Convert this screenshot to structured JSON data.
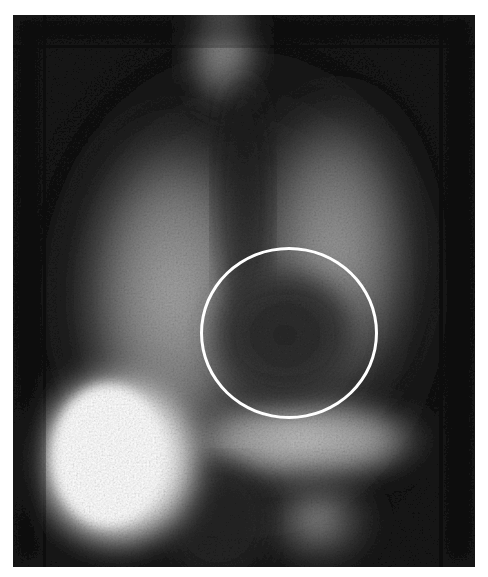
{
  "figure": {
    "type": "grayscale nuclear medicine scintigraphy (anterior chest view)",
    "description": "Perfusion/uptake scan showing bilateral lung fields, a bright hepatic region lower-left, thyroid/neck uptake at top center, and a circled photopenic region (cardiac area) center-right",
    "frame": {
      "x": 13,
      "y": 15,
      "width": 462,
      "height": 552
    },
    "background_color": "#ffffff",
    "scan_base_color": "#0c0c0c",
    "regions": [
      {
        "name": "neck-uptake",
        "cx": 210,
        "cy": 35,
        "rx": 45,
        "ry": 70,
        "intensity": 0.55
      },
      {
        "name": "right-lung-field",
        "cx": 150,
        "cy": 270,
        "rx": 110,
        "ry": 190,
        "intensity": 0.55
      },
      {
        "name": "left-lung-field",
        "cx": 320,
        "cy": 250,
        "rx": 95,
        "ry": 170,
        "intensity": 0.5
      },
      {
        "name": "liver-hot-spot",
        "cx": 110,
        "cy": 440,
        "rx": 95,
        "ry": 100,
        "intensity": 1.0
      },
      {
        "name": "lower-abdominal-band",
        "cx": 290,
        "cy": 420,
        "rx": 130,
        "ry": 45,
        "intensity": 0.7
      },
      {
        "name": "lower-right-uptake",
        "cx": 300,
        "cy": 500,
        "rx": 70,
        "ry": 60,
        "intensity": 0.5
      },
      {
        "name": "photopenic-cardiac-area",
        "cx": 275,
        "cy": 315,
        "rx": 80,
        "ry": 75,
        "intensity": -0.6
      }
    ],
    "roi_circle": {
      "cx": 289,
      "cy": 333,
      "rx": 89,
      "ry": 86,
      "stroke_color": "#ffffff",
      "stroke_width": 3
    }
  }
}
